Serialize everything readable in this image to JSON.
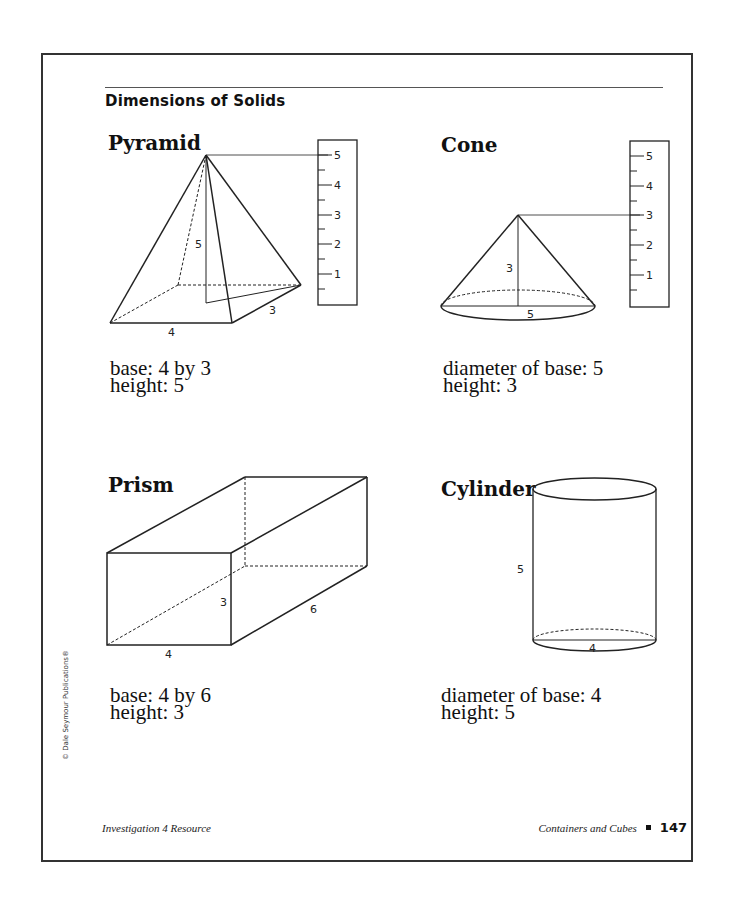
{
  "page": {
    "title": "Dimensions of Solids",
    "copyright": "© Dale Seymour Publications®",
    "footer": {
      "left": "Investigation 4 Resource",
      "book": "Containers and Cubes",
      "page_number": "147"
    }
  },
  "solids": {
    "pyramid": {
      "name": "Pyramid",
      "desc_line1": "base: 4 by 3",
      "desc_line2": "height: 5",
      "labels": {
        "height": "5",
        "width": "4",
        "depth": "3"
      },
      "ruler": [
        "5",
        "4",
        "3",
        "2",
        "1"
      ]
    },
    "cone": {
      "name": "Cone",
      "desc_line1": "diameter of base: 5",
      "desc_line2": "height: 3",
      "labels": {
        "height": "3",
        "diameter": "5"
      },
      "ruler": [
        "5",
        "4",
        "3",
        "2",
        "1"
      ]
    },
    "prism": {
      "name": "Prism",
      "desc_line1": "base: 4 by 6",
      "desc_line2": "height: 3",
      "labels": {
        "height": "3",
        "width": "4",
        "depth": "6"
      }
    },
    "cylinder": {
      "name": "Cylinder",
      "desc_line1": "diameter of base: 4",
      "desc_line2": "height: 5",
      "labels": {
        "height": "5",
        "diameter": "4"
      }
    }
  }
}
